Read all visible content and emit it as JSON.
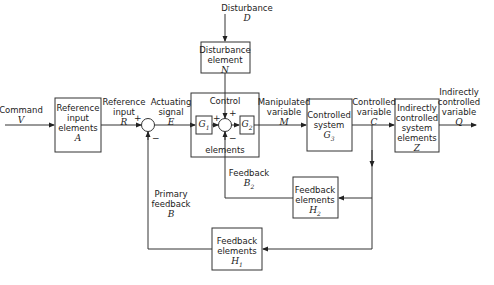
{
  "inputs": {
    "command": {
      "label": "Command",
      "symbol": "V"
    },
    "disturbance": {
      "label": "Disturbance",
      "symbol": "D"
    }
  },
  "blocks": {
    "reference_input_elements": {
      "line1": "Reference",
      "line2": "input",
      "line3": "elements",
      "symbol": "A"
    },
    "disturbance_element": {
      "line1": "Disturbance",
      "line2": "element",
      "symbol": "N"
    },
    "control_elements": {
      "top": "Control",
      "bottom": "elements",
      "g1": "G",
      "g1_sub": "1",
      "g2": "G",
      "g2_sub": "2"
    },
    "controlled_system": {
      "line1": "Controlled",
      "line2": "system",
      "symbol": "G",
      "sub": "3"
    },
    "indirectly_controlled_system": {
      "line1": "Indirectly",
      "line2": "controlled",
      "line3": "system",
      "line4": "elements",
      "symbol": "Z"
    },
    "feedback_h2": {
      "line1": "Feedback",
      "line2": "elements",
      "symbol": "H",
      "sub": "2"
    },
    "feedback_h1": {
      "line1": "Feedback",
      "line2": "elements",
      "symbol": "H",
      "sub": "1"
    }
  },
  "signals": {
    "reference_input": {
      "line1": "Reference",
      "line2": "input",
      "symbol": "R"
    },
    "actuating_signal": {
      "line1": "Actuating",
      "line2": "signal",
      "symbol": "E"
    },
    "manipulated_variable": {
      "line1": "Manipulated",
      "line2": "variable",
      "symbol": "M"
    },
    "controlled_variable": {
      "line1": "Controlled",
      "line2": "variable",
      "symbol": "C"
    },
    "indirectly_controlled_variable": {
      "line1": "Indirectly",
      "line2": "controlled",
      "line3": "variable",
      "symbol": "Q"
    },
    "feedback_b2": {
      "line1": "Feedback",
      "symbol": "B",
      "sub": "2"
    },
    "primary_feedback": {
      "line1": "Primary",
      "line2": "feedback",
      "symbol": "B"
    }
  },
  "signs": {
    "plus": "+",
    "minus": "−"
  }
}
